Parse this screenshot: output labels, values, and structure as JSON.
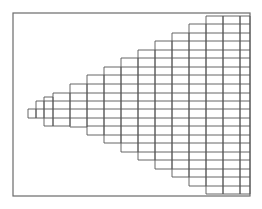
{
  "diagram": {
    "type": "staircase-refined-grid",
    "frame": {
      "x": 13,
      "y": 13,
      "width": 237,
      "height": 183,
      "stroke": "#6a6a6a"
    },
    "grid_color": "#555555",
    "row_height": 8.5,
    "columns": [
      {
        "x0": 28,
        "x1": 36,
        "top": 109,
        "bottom": 118
      },
      {
        "x0": 36,
        "x1": 44,
        "top": 101,
        "bottom": 118
      },
      {
        "x0": 44,
        "x1": 53,
        "top": 97,
        "bottom": 126
      },
      {
        "x0": 53,
        "x1": 70,
        "top": 93,
        "bottom": 126
      },
      {
        "x0": 70,
        "x1": 87,
        "top": 84,
        "bottom": 127
      },
      {
        "x0": 87,
        "x1": 104,
        "top": 75,
        "bottom": 135
      },
      {
        "x0": 104,
        "x1": 121,
        "top": 67,
        "bottom": 143
      },
      {
        "x0": 121,
        "x1": 138,
        "top": 58,
        "bottom": 152
      },
      {
        "x0": 138,
        "x1": 155,
        "top": 50,
        "bottom": 160
      },
      {
        "x0": 155,
        "x1": 172,
        "top": 41,
        "bottom": 169
      },
      {
        "x0": 172,
        "x1": 189,
        "top": 33,
        "bottom": 177
      },
      {
        "x0": 189,
        "x1": 206,
        "top": 24,
        "bottom": 186
      },
      {
        "x0": 206,
        "x1": 223,
        "top": 16,
        "bottom": 194
      },
      {
        "x0": 223,
        "x1": 240,
        "top": 16,
        "bottom": 194
      },
      {
        "x0": 240,
        "x1": 250,
        "top": 16,
        "bottom": 194
      }
    ],
    "row_lines_y": [
      16,
      24,
      33,
      41,
      50,
      58,
      67,
      75,
      84,
      93,
      101,
      109,
      118,
      126,
      135,
      143,
      152,
      160,
      169,
      177,
      186,
      194
    ]
  }
}
